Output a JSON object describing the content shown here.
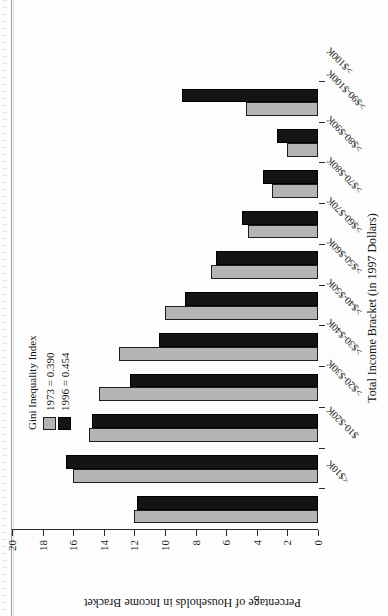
{
  "chart_data": {
    "type": "bar",
    "title": "",
    "xlabel": "Total Income Bracket (in 1997 Dollars)",
    "ylabel": "Percentage of Households in Income Bracket",
    "categories": [
      "<$10K",
      "$10-$20K",
      ">$20-$30K",
      ">$30-$40K",
      ">$40-$50K",
      ">$50-$60K",
      ">$60-$70K",
      ">$70-$80K",
      ">$80-$90K",
      ">$90-$100K",
      ">$100K"
    ],
    "series": [
      {
        "name": "1973 = 0.390",
        "color": "#b4b4b4",
        "values": [
          12.0,
          16.0,
          15.0,
          14.3,
          13.0,
          10.0,
          7.0,
          4.6,
          3.0,
          2.0,
          4.7
        ]
      },
      {
        "name": "1996 = 0.454",
        "color": "#141414",
        "values": [
          11.8,
          16.5,
          14.8,
          12.3,
          10.4,
          8.7,
          6.7,
          5.0,
          3.6,
          2.7,
          8.9
        ]
      }
    ],
    "ylim": [
      0,
      20
    ],
    "yticks": [
      0,
      2,
      4,
      6,
      8,
      10,
      12,
      14,
      16,
      18,
      20
    ],
    "grid": false,
    "orientation": "horizontal-printed-rotated",
    "legend": {
      "position": "upper-center",
      "title": "Gini Inequality Index",
      "entries": [
        "1973 = 0.390",
        "1996 = 0.454"
      ]
    }
  },
  "page": {
    "caption_fragment": ""
  }
}
